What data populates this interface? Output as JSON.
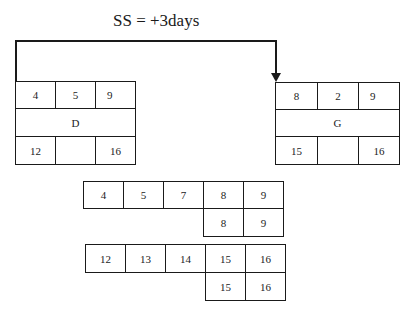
{
  "title": "SS = +3days",
  "link": {
    "type": "SS",
    "lag": "+3days",
    "from": "D",
    "to": "G"
  },
  "nodes": {
    "D": {
      "name": "D",
      "es": "4",
      "duration": "5",
      "ef": "9",
      "ls": "12",
      "float": "",
      "lf": "16"
    },
    "G": {
      "name": "G",
      "es": "8",
      "duration": "2",
      "ef": "9",
      "ls": "15",
      "float": "",
      "lf": "16"
    }
  },
  "timeline": {
    "early_row": [
      "4",
      "5",
      "7",
      "8",
      "9"
    ],
    "early_sub": [
      "8",
      "9"
    ],
    "late_row": [
      "12",
      "13",
      "14",
      "15",
      "16"
    ],
    "late_sub": [
      "15",
      "16"
    ]
  },
  "colors": {
    "line": "#1a1a1a",
    "background": "#ffffff"
  }
}
